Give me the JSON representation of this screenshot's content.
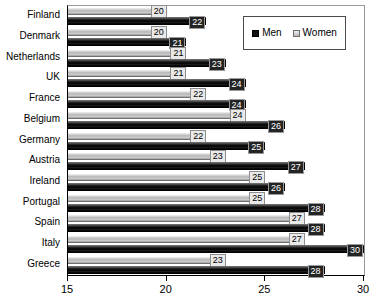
{
  "chart_data": {
    "type": "bar",
    "orientation": "horizontal",
    "title": "",
    "xlabel": "",
    "ylabel": "",
    "xlim": [
      15,
      30
    ],
    "xticks": [
      15,
      20,
      25,
      30
    ],
    "xtick_labels": [
      "15",
      "20",
      "25",
      "30"
    ],
    "grid": false,
    "legend_position": "top-right",
    "categories": [
      "Finland",
      "Denmark",
      "Netherlands",
      "UK",
      "France",
      "Belgium",
      "Germany",
      "Austria",
      "Ireland",
      "Portugal",
      "Spain",
      "Italy",
      "Greece"
    ],
    "series": [
      {
        "name": "Women",
        "color": "#bfbfbf",
        "values": [
          20,
          20,
          21,
          21,
          22,
          24,
          22,
          23,
          25,
          25,
          27,
          27,
          23
        ]
      },
      {
        "name": "Men",
        "color": "#000000",
        "values": [
          22,
          21,
          23,
          24,
          24,
          26,
          25,
          27,
          26,
          28,
          28,
          30,
          28
        ]
      }
    ]
  },
  "legend": {
    "items": [
      {
        "label": "Men",
        "swatch": "men-swatch-icon"
      },
      {
        "label": "Women",
        "swatch": "women-swatch-icon"
      }
    ]
  }
}
